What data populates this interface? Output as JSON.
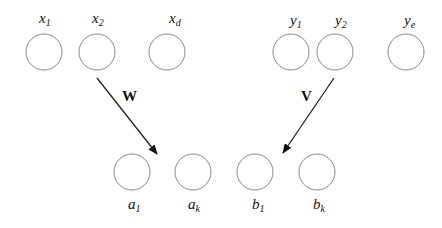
{
  "diagram": {
    "top_nodes": [
      {
        "id": "x1",
        "base": "x",
        "sub": "1",
        "cx": 44,
        "cy": 52
      },
      {
        "id": "x2",
        "base": "x",
        "sub": "2",
        "cx": 97,
        "cy": 52
      },
      {
        "id": "xd",
        "base": "x",
        "sub": "d",
        "cx": 167,
        "cy": 52
      },
      {
        "id": "y1",
        "base": "y",
        "sub": "1",
        "cx": 291,
        "cy": 52
      },
      {
        "id": "y2",
        "base": "y",
        "sub": "2",
        "cx": 335,
        "cy": 52
      },
      {
        "id": "ye",
        "base": "y",
        "sub": "e",
        "cx": 406,
        "cy": 52
      }
    ],
    "bottom_nodes": [
      {
        "id": "a1",
        "base": "a",
        "sub": "1",
        "cx": 132,
        "cy": 172
      },
      {
        "id": "ak",
        "base": "a",
        "sub": "k",
        "cx": 193,
        "cy": 172
      },
      {
        "id": "b1",
        "base": "b",
        "sub": "1",
        "cx": 255,
        "cy": 172
      },
      {
        "id": "bk",
        "base": "b",
        "sub": "k",
        "cx": 317,
        "cy": 172
      }
    ],
    "edges": [
      {
        "from": "x2",
        "to": "a-layer",
        "label": "W"
      },
      {
        "from": "y2",
        "to": "b-layer",
        "label": "V"
      }
    ],
    "node_radius": 18,
    "colors": {
      "node_stroke": "#8a8a8a",
      "edge": "#222222"
    }
  },
  "labels": {
    "x1_base": "x",
    "x1_sub": "1",
    "x2_base": "x",
    "x2_sub": "2",
    "xd_base": "x",
    "xd_sub": "d",
    "y1_base": "y",
    "y1_sub": "1",
    "y2_base": "y",
    "y2_sub": "2",
    "ye_base": "y",
    "ye_sub": "e",
    "a1_base": "a",
    "a1_sub": "1",
    "ak_base": "a",
    "ak_sub": "k",
    "b1_base": "b",
    "b1_sub": "1",
    "bk_base": "b",
    "bk_sub": "k",
    "W": "W",
    "V": "V"
  }
}
